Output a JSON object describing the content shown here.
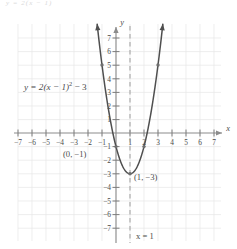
{
  "figure": {
    "kind": "coordinate-plane-parabola-graph",
    "background": "#ffffff",
    "ink_color": "#4a4a4a",
    "grid_color": "#e4e4e4",
    "axis_color": "#8a8a8a",
    "curve_color": "#4f4f4f",
    "dash_color": "#9a9a9a",
    "top_ghost_text": "y = 2(x − 1)"
  },
  "axes": {
    "x_label": "x",
    "y_label": "y",
    "x_ticks": [
      "−7",
      "−6",
      "−5",
      "−4",
      "−3",
      "−2",
      "−1",
      "1",
      "2",
      "3",
      "4",
      "5",
      "6",
      "7"
    ],
    "y_ticks_positive": [
      "7",
      "6",
      "5",
      "4",
      "3",
      "2",
      "1"
    ],
    "y_ticks_negative": [
      "−1",
      "−2",
      "−3",
      "−4",
      "−5",
      "−6",
      "−7"
    ],
    "xlim": [
      -7.6,
      7.8
    ],
    "ylim": [
      -7.9,
      8.0
    ],
    "grid": true
  },
  "labels": {
    "equation": "y = 2(x − 1)",
    "equation_exponent": "2",
    "equation_tail": " − 3",
    "y_intercept_point": "(0, −1)",
    "vertex_point": "(1, −3)",
    "axis_of_symmetry": "x = 1"
  },
  "chart_data": {
    "type": "line",
    "title": "",
    "subtitle": "",
    "xlabel": "x",
    "ylabel": "y",
    "xlim": [
      -7.6,
      7.8
    ],
    "ylim": [
      -7.9,
      8.0
    ],
    "grid": true,
    "legend": "none",
    "series": [
      {
        "name": "y = 2(x − 1)^2 − 3",
        "equation": "y = 2(x - 1)^2 - 3",
        "vertex": [
          1,
          -3
        ],
        "a": 2,
        "h": 1,
        "k": -3,
        "opens": "up",
        "x": [
          -1.05,
          -0.8,
          -0.6,
          -0.4,
          -0.2,
          0,
          0.2,
          0.4,
          0.6,
          0.8,
          1,
          1.2,
          1.4,
          1.6,
          1.8,
          2,
          2.2,
          2.4,
          2.6,
          2.8,
          3,
          3.05
        ],
        "y": [
          5.41,
          3.48,
          2.12,
          0.92,
          -0.12,
          -1,
          -1.72,
          -2.28,
          -2.68,
          -2.92,
          -3,
          -2.92,
          -2.68,
          -2.28,
          -1.72,
          -1,
          -0.12,
          0.92,
          2.12,
          3.48,
          5,
          5.41
        ],
        "arrow_ends": [
          "both"
        ]
      }
    ],
    "marked_points": [
      {
        "label": "(0, −1)",
        "x": 0,
        "y": -1
      },
      {
        "label": "(1, −3)",
        "x": 1,
        "y": -3
      },
      {
        "label": "",
        "x": -1,
        "y": 5
      },
      {
        "label": "",
        "x": 3,
        "y": 5
      },
      {
        "label": "",
        "x": 2,
        "y": -1
      }
    ],
    "annotations": [
      {
        "text": "y = 2(x − 1)² − 3",
        "x": -5.6,
        "y": 3.2
      },
      {
        "text": "(0, −1)",
        "x": -1.9,
        "y": -1.55
      },
      {
        "text": "(1, −3)",
        "x": 1.55,
        "y": -3.45
      },
      {
        "text": "x = 1",
        "x": 1.35,
        "y": -7.6
      }
    ],
    "reference_lines": [
      {
        "type": "vertical",
        "x": 1,
        "style": "dashed",
        "label": "x = 1"
      }
    ]
  }
}
